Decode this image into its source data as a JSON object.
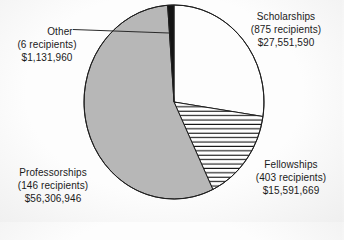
{
  "figure": {
    "background_color": "#f4f4f4",
    "outline_color": "#1f1f1f",
    "text_color": "#1a1a1a"
  },
  "chart_data": {
    "type": "pie",
    "title": "",
    "units": "USD",
    "total_amount_usd": 100582165,
    "total_recipients": 1430,
    "direction": "clockwise",
    "start_angle_deg_from_top": 0,
    "legend_position": "none",
    "segments": [
      {
        "name": "Scholarships",
        "recipients": 875,
        "recipients_label": "(875 recipients)",
        "amount_usd": 27551590,
        "amount_label": "$27,551,590",
        "percent": 27.4,
        "fill_style": "white",
        "color": "#fdfdfd",
        "label_position": "top-right"
      },
      {
        "name": "Fellowships",
        "recipients": 403,
        "recipients_label": "(403 recipients)",
        "amount_usd": 15591669,
        "amount_label": "$15,591,669",
        "percent": 15.5,
        "fill_style": "hatch-horizontal",
        "color": "#ffffff",
        "hatch_color": "#141414",
        "label_position": "bottom-right"
      },
      {
        "name": "Professorships",
        "recipients": 146,
        "recipients_label": "(146 recipients)",
        "amount_usd": 56306946,
        "amount_label": "$56,306,946",
        "percent": 56.0,
        "fill_style": "solid-gray",
        "color": "#b7b7b7",
        "label_position": "bottom-left"
      },
      {
        "name": "Other",
        "recipients": 6,
        "recipients_label": "(6 recipients)",
        "amount_usd": 1131960,
        "amount_label": "$1,131,960",
        "percent": 1.1,
        "fill_style": "solid-black",
        "color": "#141414",
        "label_position": "top-left",
        "has_leader_line": true
      }
    ]
  }
}
